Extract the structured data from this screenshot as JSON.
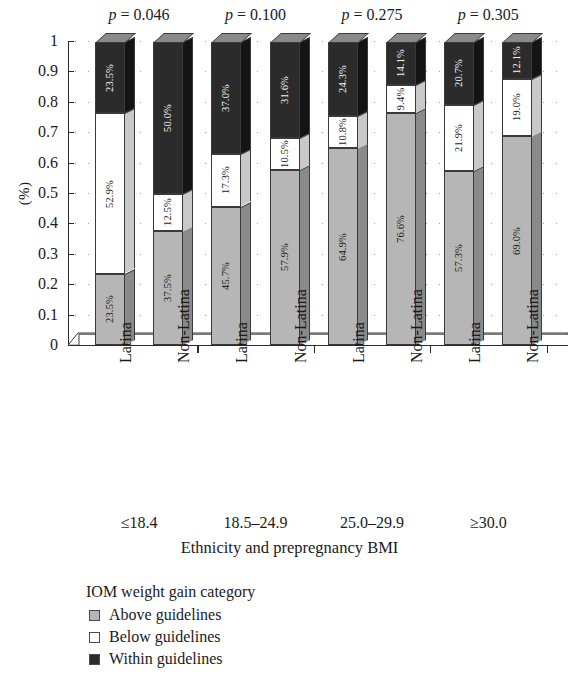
{
  "chart_data": {
    "type": "bar",
    "subtype": "stacked-100-percent-3d",
    "title": "",
    "xlabel": "Ethnicity and prepregnancy BMI",
    "ylabel": "(%)",
    "ylim": [
      0,
      1
    ],
    "ytick_labels": [
      "1",
      "0.9",
      "0.8",
      "0.7",
      "0.6",
      "0.5",
      "0.4",
      "0.3",
      "0.2",
      "0.1",
      "0"
    ],
    "ytick_values": [
      1,
      0.9,
      0.8,
      0.7,
      0.6,
      0.5,
      0.4,
      0.3,
      0.2,
      0.1,
      0
    ],
    "grid": "dotted-horizontal",
    "legend_position": "below-left",
    "legend_title": "IOM weight gain category",
    "categories": [
      "Latina",
      "Non-Latina",
      "Latina",
      "Non-Latina",
      "Latina",
      "Non-Latina",
      "Latina",
      "Non-Latina"
    ],
    "groups": [
      {
        "label": "≤18.4",
        "pvalue": "p = 0.046"
      },
      {
        "label": "18.5–24.9",
        "pvalue": "p = 0.100"
      },
      {
        "label": "25.0–29.9",
        "pvalue": "p = 0.275"
      },
      {
        "label": "≥30.0",
        "pvalue": "p = 0.305"
      }
    ],
    "series": [
      {
        "name": "Above guidelines",
        "color": "#b6b6b6",
        "values": [
          23.5,
          37.5,
          45.7,
          57.9,
          64.9,
          76.6,
          57.3,
          69.0
        ],
        "labels": [
          "23.5%",
          "37.5%",
          "45.7%",
          "57.9%",
          "64.9%",
          "76.6%",
          "57.3%",
          "69.0%"
        ]
      },
      {
        "name": "Below guidelines",
        "color": "#ffffff",
        "values": [
          52.9,
          12.5,
          17.3,
          10.5,
          10.8,
          9.4,
          21.9,
          19.0
        ],
        "labels": [
          "52.9%",
          "12.5%",
          "17.3%",
          "10.5%",
          "10.8%",
          "9.4%",
          "21.9%",
          "19.0%"
        ]
      },
      {
        "name": "Within guidelines",
        "color": "#2b2b2b",
        "values": [
          23.5,
          50.0,
          37.0,
          31.6,
          24.3,
          14.1,
          20.7,
          12.1
        ],
        "labels": [
          "23.5%",
          "50.0%",
          "37.0%",
          "31.6%",
          "24.3%",
          "14.1%",
          "20.7%",
          "12.1%"
        ]
      }
    ]
  },
  "legend": {
    "title": "IOM weight gain category",
    "items": [
      {
        "label": "Above guidelines",
        "color": "#b6b6b6"
      },
      {
        "label": "Below guidelines",
        "color": "#ffffff"
      },
      {
        "label": "Within guidelines",
        "color": "#2b2b2b"
      }
    ]
  },
  "colors": {
    "above": "#b6b6b6",
    "below": "#ffffff",
    "within": "#2b2b2b",
    "axis": "#2b2b2b",
    "grid": "#8d8d8d",
    "side_above": "#8a8a8a",
    "side_below": "#c9c9c9",
    "side_within": "#141414"
  }
}
